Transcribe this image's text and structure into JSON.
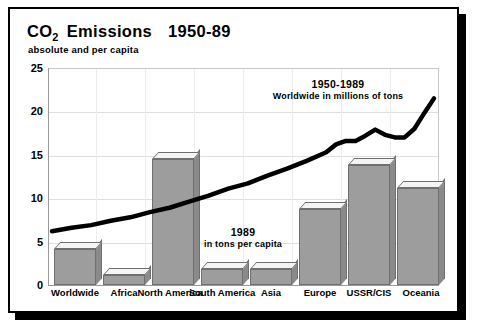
{
  "figure": {
    "title_prefix": "CO",
    "title_subscript": "2",
    "title_rest": "Emissions",
    "title_years": "1950-89",
    "subtitle": "absolute and per capita",
    "frame_color": "#000000",
    "bar_face_color": "#9d9d9d",
    "bar_top_color": "#f4f4f4",
    "bar_side_color": "#8a8a8a",
    "line_color": "#000000",
    "grid_color": "#dedede",
    "background": "#ffffff"
  },
  "annotations": [
    {
      "id": "line-series-label",
      "line1": "1950-1989",
      "line2": "Worldwide in millions of tons"
    },
    {
      "id": "bar-series-label",
      "line1": "1989",
      "line2": "in tons per capita"
    }
  ],
  "chart_data": {
    "type": "bar",
    "subtitle": "absolute and per capita",
    "xlabel": "",
    "ylabel": "",
    "ylim": [
      0,
      25
    ],
    "yticks": [
      0,
      5,
      10,
      15,
      20,
      25
    ],
    "ytick_labels": [
      "0",
      "5",
      "10",
      "15",
      "20",
      "25"
    ],
    "grid": true,
    "legend_position": "none",
    "categories": [
      "Worldwide",
      "Africa",
      "North America",
      "South America",
      "Asia",
      "Europe",
      "USSR/CIS",
      "Oceania"
    ],
    "series": [
      {
        "name": "1989 in tons per capita",
        "type": "bar",
        "values": [
          4.2,
          1.2,
          14.5,
          1.8,
          1.8,
          8.8,
          13.8,
          11.2
        ]
      },
      {
        "name": "1950-1989 Worldwide in millions of tons",
        "type": "line",
        "x": [
          1950,
          1952,
          1954,
          1956,
          1958,
          1960,
          1962,
          1964,
          1966,
          1968,
          1970,
          1972,
          1974,
          1976,
          1978,
          1979,
          1980,
          1981,
          1982,
          1983,
          1984,
          1985,
          1986,
          1987,
          1988,
          1989
        ],
        "values": [
          6.2,
          6.6,
          6.9,
          7.4,
          7.8,
          8.4,
          8.9,
          9.6,
          10.3,
          11.1,
          11.7,
          12.6,
          13.4,
          14.3,
          15.3,
          16.2,
          16.6,
          16.6,
          17.2,
          17.9,
          17.3,
          17.0,
          17.0,
          18.0,
          19.8,
          21.5
        ]
      }
    ]
  }
}
